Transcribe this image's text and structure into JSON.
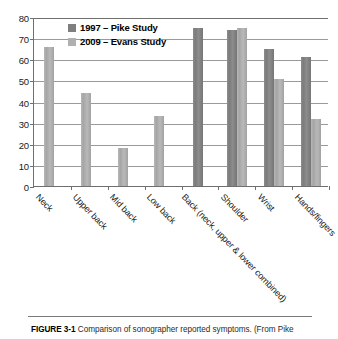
{
  "figure": {
    "caption_label": "FIGURE 3-1",
    "caption_text": "Comparison of sonographer reported symptoms. (From Pike"
  },
  "legend": {
    "position": "inside-top-left",
    "entries": [
      {
        "label": "1997 – Pike Study",
        "color": "#7f7f7f"
      },
      {
        "label": "2009 – Evans Study",
        "color": "#b0b0b0"
      }
    ]
  },
  "axis": {
    "y_ticks": [
      "0",
      "10",
      "20",
      "30",
      "40",
      "50",
      "60",
      "70",
      "80"
    ],
    "x_categories": [
      "Neck",
      "Upper back",
      "Mid back",
      "Low back",
      "Back (neck, upper & lower combined)",
      "Shoulder",
      "Wrist",
      "Hands/fingers"
    ]
  },
  "chart_data": {
    "type": "bar",
    "title": "",
    "subtitle": "",
    "xlabel": "",
    "ylabel": "",
    "ylim": [
      0,
      80
    ],
    "ytick_step": 10,
    "grid": true,
    "legend_position": "inside-top-left",
    "categories": [
      "Neck",
      "Upper back",
      "Mid back",
      "Low back",
      "Back (neck, upper & lower combined)",
      "Shoulder",
      "Wrist",
      "Hands/fingers"
    ],
    "series": [
      {
        "name": "1997 – Pike Study",
        "color": "#7f7f7f",
        "values": [
          null,
          null,
          null,
          null,
          75,
          74,
          65,
          61
        ]
      },
      {
        "name": "2009 – Evans Study",
        "color": "#b0b0b0",
        "values": [
          66,
          44,
          18,
          33,
          null,
          75,
          50.5,
          31.5
        ]
      }
    ]
  }
}
